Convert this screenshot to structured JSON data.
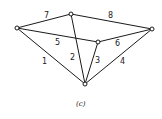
{
  "diagram": {
    "type": "graph",
    "caption": "(c)",
    "colors": {
      "stroke": "#1a1a1a",
      "background": "#ffffff"
    },
    "nodes": [
      {
        "id": "A",
        "x": 17,
        "y": 28
      },
      {
        "id": "B",
        "x": 71,
        "y": 14
      },
      {
        "id": "C",
        "x": 152,
        "y": 29
      },
      {
        "id": "D",
        "x": 98,
        "y": 42
      },
      {
        "id": "E",
        "x": 85,
        "y": 84
      }
    ],
    "edges": [
      {
        "label": "1",
        "from": "A",
        "to": "E",
        "lx": 42,
        "ly": 64
      },
      {
        "label": "2",
        "from": "B",
        "to": "E",
        "lx": 70,
        "ly": 60
      },
      {
        "label": "3",
        "from": "D",
        "to": "E",
        "lx": 95,
        "ly": 63
      },
      {
        "label": "4",
        "from": "C",
        "to": "E",
        "lx": 120,
        "ly": 64
      },
      {
        "label": "5",
        "from": "A",
        "to": "D",
        "lx": 55,
        "ly": 45
      },
      {
        "label": "6",
        "from": "D",
        "to": "C",
        "lx": 115,
        "ly": 46
      },
      {
        "label": "7",
        "from": "A",
        "to": "B",
        "lx": 44,
        "ly": 18
      },
      {
        "label": "8",
        "from": "B",
        "to": "C",
        "lx": 108,
        "ly": 18
      }
    ]
  }
}
